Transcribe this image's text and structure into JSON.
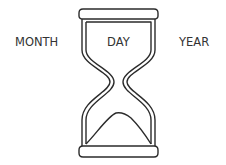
{
  "labels": {
    "month": "MONTH",
    "day": "DAY",
    "year": "YEAR"
  },
  "icon": "hourglass-icon",
  "colors": {
    "stroke": "#2b2b2b",
    "text": "#333333",
    "background": "#ffffff"
  }
}
